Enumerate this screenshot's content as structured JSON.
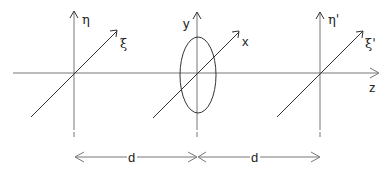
{
  "diagram": {
    "planes": [
      {
        "name": "input-plane",
        "vertical_label": "η",
        "diagonal_label": "ξ"
      },
      {
        "name": "aperture-plane",
        "vertical_label": "y",
        "diagonal_label": "x"
      },
      {
        "name": "output-plane",
        "vertical_label": "η'",
        "diagonal_label": "ξ'"
      }
    ],
    "optical_axis_label": "z",
    "distances": [
      {
        "label": "d"
      },
      {
        "label": "d"
      }
    ],
    "colors": {
      "line": "#333333",
      "dimension": "#777777"
    }
  }
}
